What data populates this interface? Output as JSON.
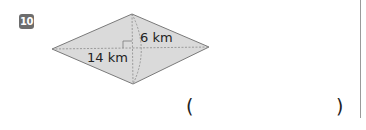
{
  "problem": {
    "number": "10",
    "figure": {
      "shape": "rhombus",
      "diagonal_label_long": "14 km",
      "diagonal_label_short": "6 km",
      "fill_color": "#d9d9d9",
      "stroke_color": "#7a7a7a"
    },
    "answer_open": "(",
    "answer_close": ")"
  }
}
